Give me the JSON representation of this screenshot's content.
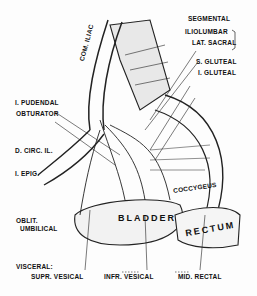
{
  "figure": {
    "labels": {
      "segmental": "SEGMENTAL",
      "iliolumbar": "ILIOLUMBAR",
      "lat_sacral": "LAT. SACRAL",
      "s_gluteal": "S. GLUTEAL",
      "i_gluteal": "I. GLUTEAL",
      "com_iliac": "COM. ILIAC",
      "i_pudendal": "I. PUDENDAL",
      "obturator": "OBTURATOR",
      "d_circ_il": "D. CIRC. IL.",
      "i_epig": "I. EPIG.",
      "coccygeus": "COCCYGEUS",
      "oblit_umbilical_1": "OBLIT.",
      "oblit_umbilical_2": "UMBILICAL",
      "bladder": "BLADDER",
      "rectum": "RECTUM",
      "visceral": "VISCERAL:",
      "supr_vesical": "SUPR. VESICAL",
      "infr_vesical": "INFR. VESICAL",
      "mid_rectal": "MID. RECTAL"
    }
  }
}
